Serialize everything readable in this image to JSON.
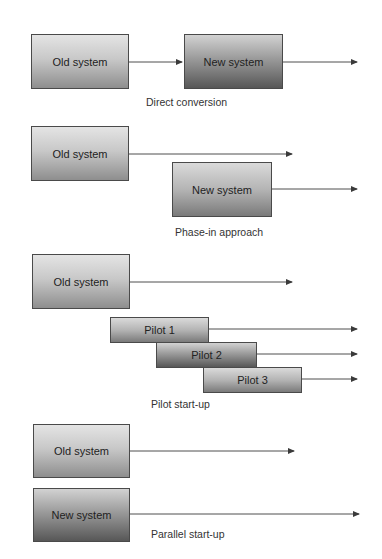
{
  "diagram": {
    "sections": [
      {
        "caption": "Direct conversion",
        "boxes": [
          {
            "label": "Old system",
            "shade": "light"
          },
          {
            "label": "New system",
            "shade": "dark"
          }
        ]
      },
      {
        "caption": "Phase-in approach",
        "boxes": [
          {
            "label": "Old system",
            "shade": "light"
          },
          {
            "label": "New system",
            "shade": "light"
          }
        ]
      },
      {
        "caption": "Pilot start-up",
        "boxes": [
          {
            "label": "Old system",
            "shade": "light"
          },
          {
            "label": "Pilot 1",
            "shade": "light"
          },
          {
            "label": "Pilot 2",
            "shade": "dark"
          },
          {
            "label": "Pilot 3",
            "shade": "light"
          }
        ]
      },
      {
        "caption": "Parallel start-up",
        "boxes": [
          {
            "label": "Old system",
            "shade": "light"
          },
          {
            "label": "New system",
            "shade": "dark"
          }
        ]
      }
    ]
  },
  "colors": {
    "line": "#3a3a3a",
    "box_border": "#4a4a4a",
    "text": "#222222"
  }
}
